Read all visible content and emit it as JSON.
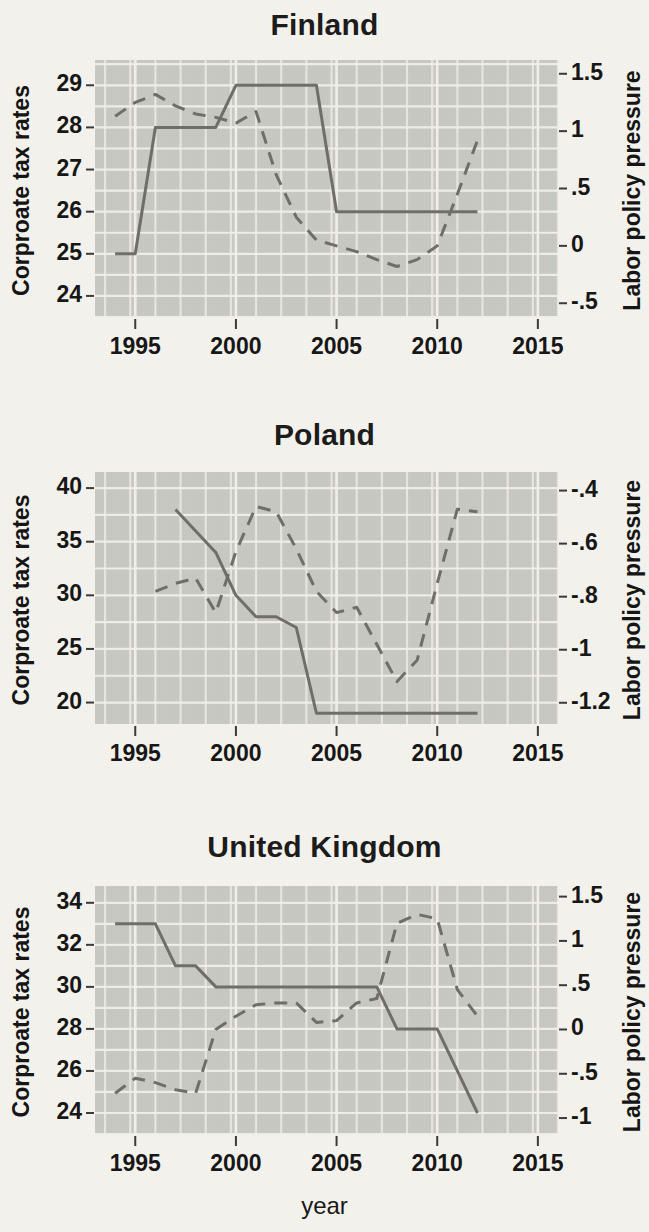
{
  "figure": {
    "background_color": "#f5f3ed",
    "plot_background_color": "#c9c9c3",
    "gridline_color": "#f2f0ea",
    "line_color": "#6f6f68",
    "x_axis_title": "year",
    "left_axis_title": "Corproate tax rates",
    "right_axis_title": "Labor policy pressure",
    "x_ticks": [
      "1995",
      "2000",
      "2005",
      "2010",
      "2015"
    ],
    "x_tick_values": [
      1995,
      2000,
      2005,
      2010,
      2015
    ],
    "x_range": [
      1993,
      2016
    ]
  },
  "chart_data": [
    {
      "type": "line",
      "title": "Finland",
      "xlabel": "year",
      "ylabel": "Corproate tax rates",
      "y2label": "Labor policy pressure",
      "xlim": [
        1993,
        2016
      ],
      "ylim": [
        23.5,
        29.6
      ],
      "y2lim": [
        -0.62,
        1.62
      ],
      "grid": true,
      "legend": "none",
      "yticks": [
        "29",
        "28",
        "27",
        "26",
        "25",
        "24"
      ],
      "ytick_values": [
        29,
        28,
        27,
        26,
        25,
        24
      ],
      "y2ticks": [
        "1.5",
        "1",
        ".5",
        "0",
        "-.5"
      ],
      "y2tick_values": [
        1.5,
        1,
        0.5,
        0,
        -0.5
      ],
      "xticks": [
        "1995",
        "2000",
        "2005",
        "2010",
        "2015"
      ],
      "series": [
        {
          "name": "Corporate tax rate",
          "style": "solid",
          "axis": "left",
          "x": [
            1994,
            1995,
            1996,
            1997,
            1998,
            1999,
            2000,
            2001,
            2002,
            2003,
            2004,
            2005,
            2006,
            2007,
            2008,
            2009,
            2010,
            2011,
            2012
          ],
          "values": [
            25,
            25,
            28,
            28,
            28,
            28,
            29,
            29,
            29,
            29,
            29,
            26,
            26,
            26,
            26,
            26,
            26,
            26,
            26
          ]
        },
        {
          "name": "Labor policy pressure",
          "style": "dashed",
          "axis": "right",
          "x": [
            1994,
            1995,
            1996,
            1997,
            1998,
            1999,
            2000,
            2001,
            2002,
            2003,
            2004,
            2005,
            2006,
            2007,
            2008,
            2009,
            2010,
            2011,
            2012
          ],
          "values": [
            1.13,
            1.25,
            1.32,
            1.22,
            1.15,
            1.12,
            1.07,
            1.17,
            0.62,
            0.25,
            0.05,
            0.0,
            -0.05,
            -0.12,
            -0.18,
            -0.12,
            0.0,
            0.45,
            0.92
          ]
        }
      ]
    },
    {
      "type": "line",
      "title": "Poland",
      "xlabel": "year",
      "ylabel": "Corproate tax rates",
      "y2label": "Labor policy pressure",
      "xlim": [
        1993,
        2016
      ],
      "ylim": [
        18.0,
        41.5
      ],
      "y2lim": [
        -1.28,
        -0.33
      ],
      "grid": true,
      "legend": "none",
      "yticks": [
        "40",
        "35",
        "30",
        "25",
        "20"
      ],
      "ytick_values": [
        40,
        35,
        30,
        25,
        20
      ],
      "y2ticks": [
        "-.4",
        "-.6",
        "-.8",
        "-1",
        "-1.2"
      ],
      "y2tick_values": [
        -0.4,
        -0.6,
        -0.8,
        -1.0,
        -1.2
      ],
      "xticks": [
        "1995",
        "2000",
        "2005",
        "2010",
        "2015"
      ],
      "series": [
        {
          "name": "Corporate tax rate",
          "style": "solid",
          "axis": "left",
          "x": [
            1997,
            1998,
            1999,
            2000,
            2001,
            2002,
            2003,
            2004,
            2005,
            2006,
            2007,
            2008,
            2009,
            2010,
            2011,
            2012
          ],
          "values": [
            38,
            36,
            34,
            30,
            28,
            28,
            27,
            19,
            19,
            19,
            19,
            19,
            19,
            19,
            19,
            19
          ]
        },
        {
          "name": "Labor policy pressure",
          "style": "dashed",
          "axis": "right",
          "x": [
            1996,
            1997,
            1998,
            1999,
            2000,
            2001,
            2002,
            2003,
            2004,
            2005,
            2006,
            2007,
            2008,
            2009,
            2010,
            2011,
            2012
          ],
          "values": [
            -0.78,
            -0.75,
            -0.73,
            -0.86,
            -0.63,
            -0.46,
            -0.48,
            -0.62,
            -0.78,
            -0.86,
            -0.84,
            -0.98,
            -1.12,
            -1.04,
            -0.75,
            -0.47,
            -0.48
          ]
        }
      ]
    },
    {
      "type": "line",
      "title": "United Kingdom",
      "xlabel": "year",
      "ylabel": "Corproate tax rates",
      "y2label": "Labor policy pressure",
      "xlim": [
        1993,
        2016
      ],
      "ylim": [
        23.0,
        34.8
      ],
      "y2lim": [
        -1.18,
        1.62
      ],
      "grid": true,
      "legend": "none",
      "yticks": [
        "34",
        "32",
        "30",
        "28",
        "26",
        "24"
      ],
      "ytick_values": [
        34,
        32,
        30,
        28,
        26,
        24
      ],
      "y2ticks": [
        "1.5",
        "1",
        ".5",
        "0",
        "-.5",
        "-1"
      ],
      "y2tick_values": [
        1.5,
        1,
        0.5,
        0,
        -0.5,
        -1
      ],
      "xticks": [
        "1995",
        "2000",
        "2005",
        "2010",
        "2015"
      ],
      "series": [
        {
          "name": "Corporate tax rate",
          "style": "solid",
          "axis": "left",
          "x": [
            1994,
            1995,
            1996,
            1997,
            1998,
            1999,
            2000,
            2001,
            2002,
            2003,
            2004,
            2005,
            2006,
            2007,
            2008,
            2009,
            2010,
            2011,
            2012
          ],
          "values": [
            33,
            33,
            33,
            31,
            31,
            30,
            30,
            30,
            30,
            30,
            30,
            30,
            30,
            30,
            28,
            28,
            28,
            26,
            24
          ]
        },
        {
          "name": "Labor policy pressure",
          "style": "dashed",
          "axis": "right",
          "x": [
            1994,
            1995,
            1996,
            1997,
            1998,
            1999,
            2000,
            2001,
            2002,
            2003,
            2004,
            2005,
            2006,
            2007,
            2008,
            2009,
            2010,
            2011,
            2012
          ],
          "values": [
            -0.72,
            -0.55,
            -0.6,
            -0.68,
            -0.72,
            0.0,
            0.15,
            0.28,
            0.3,
            0.3,
            0.08,
            0.1,
            0.3,
            0.35,
            1.2,
            1.3,
            1.25,
            0.45,
            0.15
          ]
        }
      ]
    }
  ]
}
